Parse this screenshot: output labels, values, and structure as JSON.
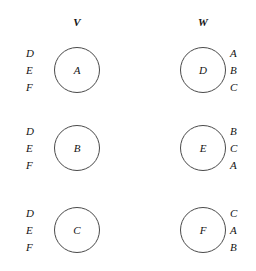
{
  "diagram": {
    "type": "bipartite-preference-lists",
    "columns": [
      {
        "id": "V",
        "header": "V"
      },
      {
        "id": "W",
        "header": "W"
      }
    ],
    "rows": [
      {
        "left_preferences": [
          "D",
          "E",
          "F"
        ],
        "left_node": "A",
        "right_node": "D",
        "right_preferences": [
          "A",
          "B",
          "C"
        ]
      },
      {
        "left_preferences": [
          "D",
          "E",
          "F"
        ],
        "left_node": "B",
        "right_node": "E",
        "right_preferences": [
          "B",
          "C",
          "A"
        ]
      },
      {
        "left_preferences": [
          "D",
          "E",
          "F"
        ],
        "left_node": "C",
        "right_node": "F",
        "right_preferences": [
          "C",
          "A",
          "B"
        ]
      }
    ],
    "colors": {
      "background": "#ffffff",
      "stroke": "#4a4a4a",
      "text": "#141414"
    }
  }
}
